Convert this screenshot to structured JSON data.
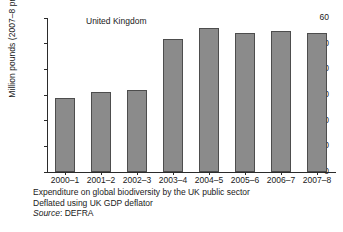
{
  "chart_data": {
    "type": "bar",
    "title": "United Kingdom",
    "xlabel": "",
    "ylabel": "Million pounds (2007–8 prices)",
    "categories": [
      "2000–1",
      "2001–2",
      "2002–3",
      "2003–4",
      "2004–5",
      "2005–6",
      "2006–7",
      "2007–8"
    ],
    "values": [
      29,
      31,
      32,
      52,
      56,
      54,
      55,
      54
    ],
    "ylim": [
      0,
      60
    ],
    "yticks": [
      0,
      10,
      20,
      30,
      40,
      50,
      60
    ],
    "ytick_labels": [
      "0",
      "10",
      "20",
      "30",
      "40",
      "50",
      "60"
    ],
    "grid": false,
    "legend": "none",
    "bar_color": "#8b8b8b",
    "bar_edge_color": "#4d4d4d",
    "axis_color": "#2b2b2b",
    "background": "#ffffff"
  },
  "caption": {
    "line1": "Expenditure on global biodiversity by the UK public sector",
    "line2": "Deflated using UK GDP deflator",
    "source_word": "Source",
    "source_value": ": DEFRA"
  }
}
